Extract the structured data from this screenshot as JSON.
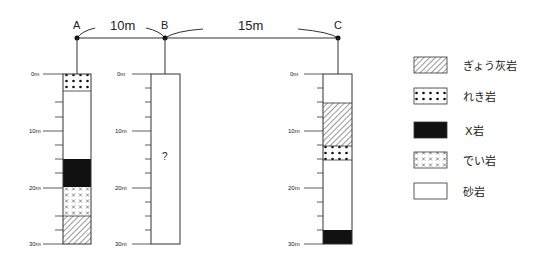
{
  "points": [
    {
      "id": "A",
      "label": "A"
    },
    {
      "id": "B",
      "label": "B"
    },
    {
      "id": "C",
      "label": "C"
    }
  ],
  "distances": {
    "ab": "10m",
    "bc": "15m"
  },
  "depth_ticks": [
    "0m",
    "10m",
    "20m",
    "30m"
  ],
  "columns": {
    "A": [
      {
        "from": 0,
        "to": 3,
        "rock": "conglomerate"
      },
      {
        "from": 3,
        "to": 15,
        "rock": "sandstone"
      },
      {
        "from": 15,
        "to": 20,
        "rock": "x_rock"
      },
      {
        "from": 20,
        "to": 25,
        "rock": "mudstone"
      },
      {
        "from": 25,
        "to": 30,
        "rock": "tuff"
      }
    ],
    "B": {
      "unknown_mark": "?"
    },
    "C": [
      {
        "from": 0,
        "to": 5,
        "rock": "sandstone"
      },
      {
        "from": 5,
        "to": 12.5,
        "rock": "tuff"
      },
      {
        "from": 12.5,
        "to": 15,
        "rock": "conglomerate"
      },
      {
        "from": 15,
        "to": 27.5,
        "rock": "sandstone"
      },
      {
        "from": 27.5,
        "to": 30,
        "rock": "x_rock"
      }
    ]
  },
  "legend": [
    {
      "rock": "tuff",
      "label": "ぎょう灰岩"
    },
    {
      "rock": "conglomerate",
      "label": "れき岩"
    },
    {
      "rock": "x_rock",
      "label": "X岩"
    },
    {
      "rock": "mudstone",
      "label": "でい岩"
    },
    {
      "rock": "sandstone",
      "label": "砂岩"
    }
  ]
}
